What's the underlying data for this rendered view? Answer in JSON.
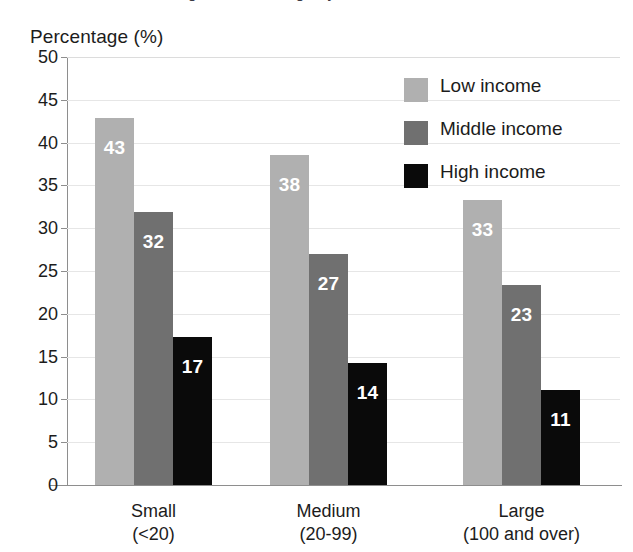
{
  "axis_title": "Percentage (%)",
  "partial_title": "Figure: Percentage by size and income",
  "colors": {
    "low_income": "#b0b0b0",
    "middle_income": "#707070",
    "high_income": "#0a0a0a",
    "gridline": "#e6e6e6",
    "axis": "#8e8e8e",
    "text": "#1c1c1c",
    "bar_label": "#ffffff",
    "background": "#ffffff"
  },
  "legend": {
    "position": "top-right",
    "entries": [
      {
        "label": "Low income",
        "color": "#b0b0b0"
      },
      {
        "label": "Middle income",
        "color": "#707070"
      },
      {
        "label": "High income",
        "color": "#0a0a0a"
      }
    ]
  },
  "categories_detail": [
    {
      "line1": "Small",
      "line2": "(<20)"
    },
    {
      "line1": "Medium",
      "line2": "(20-99)"
    },
    {
      "line1": "Large",
      "line2": "(100 and over)"
    }
  ],
  "y_ticks": [
    "0",
    "5",
    "10",
    "15",
    "20",
    "25",
    "30",
    "35",
    "40",
    "45",
    "50"
  ],
  "chart_data": {
    "type": "bar",
    "title": "",
    "xlabel": "",
    "ylabel": "Percentage (%)",
    "ylim": [
      0,
      50
    ],
    "ytick_step": 5,
    "grid": true,
    "legend_position": "top-right",
    "categories": [
      "Small (<20)",
      "Medium (20-99)",
      "Large (100 and over)"
    ],
    "series": [
      {
        "name": "Low income",
        "color": "#b0b0b0",
        "values": [
          43,
          38,
          33
        ]
      },
      {
        "name": "Middle income",
        "color": "#707070",
        "values": [
          32,
          27,
          23
        ]
      },
      {
        "name": "High income",
        "color": "#0a0a0a",
        "values": [
          17,
          14,
          11
        ]
      }
    ],
    "bar_labels": [
      [
        "43",
        "32",
        "17"
      ],
      [
        "38",
        "27",
        "14"
      ],
      [
        "33",
        "23",
        "11"
      ]
    ],
    "bar_value_precise": {
      "low_income": [
        42.9,
        38.6,
        33.3
      ],
      "middle_income": [
        31.9,
        27.0,
        23.4
      ],
      "high_income": [
        17.3,
        14.2,
        11.1
      ]
    }
  }
}
